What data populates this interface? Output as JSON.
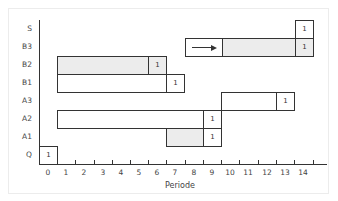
{
  "diagram": {
    "type": "gantt-like-period-chart",
    "xlabel": "Periode",
    "x_ticks": [
      "0",
      "1",
      "2",
      "3",
      "4",
      "5",
      "6",
      "7",
      "8",
      "9",
      "10",
      "11",
      "12",
      "13",
      "14"
    ],
    "rows": [
      {
        "label": "S",
        "segments": [
          {
            "start": 14,
            "end": 15,
            "style": "white",
            "text": "1"
          }
        ]
      },
      {
        "label": "B3",
        "segments": [
          {
            "start": 8,
            "end": 10,
            "style": "white",
            "text": "",
            "arrow": true
          },
          {
            "start": 10,
            "end": 14,
            "style": "shaded",
            "text": ""
          },
          {
            "start": 14,
            "end": 15,
            "style": "shaded",
            "text": "1"
          }
        ]
      },
      {
        "label": "B2",
        "segments": [
          {
            "start": 1,
            "end": 6,
            "style": "shaded",
            "text": ""
          },
          {
            "start": 6,
            "end": 7,
            "style": "shaded",
            "text": "1"
          }
        ]
      },
      {
        "label": "B1",
        "segments": [
          {
            "start": 1,
            "end": 7,
            "style": "white",
            "text": ""
          },
          {
            "start": 7,
            "end": 8,
            "style": "white",
            "text": "1"
          }
        ]
      },
      {
        "label": "A3",
        "segments": [
          {
            "start": 10,
            "end": 13,
            "style": "white",
            "text": ""
          },
          {
            "start": 13,
            "end": 14,
            "style": "white",
            "text": "1"
          }
        ]
      },
      {
        "label": "A2",
        "segments": [
          {
            "start": 1,
            "end": 9,
            "style": "white",
            "text": ""
          },
          {
            "start": 9,
            "end": 10,
            "style": "white",
            "text": "1"
          }
        ]
      },
      {
        "label": "A1",
        "segments": [
          {
            "start": 7,
            "end": 9,
            "style": "shaded",
            "text": ""
          },
          {
            "start": 9,
            "end": 10,
            "style": "white",
            "text": "1"
          }
        ]
      },
      {
        "label": "Q",
        "segments": [
          {
            "start": 0,
            "end": 1,
            "style": "white",
            "text": "1"
          }
        ]
      }
    ],
    "colors": {
      "line": "#333333",
      "shaded": "#ececec",
      "background": "#ffffff"
    }
  },
  "labels": {
    "rows": [
      "S",
      "B3",
      "B2",
      "B1",
      "A3",
      "A2",
      "A1",
      "Q"
    ],
    "cell_value": "1",
    "xlabel": "Periode",
    "ticks": [
      "0",
      "1",
      "2",
      "3",
      "4",
      "5",
      "6",
      "7",
      "8",
      "9",
      "10",
      "11",
      "12",
      "13",
      "14"
    ]
  }
}
